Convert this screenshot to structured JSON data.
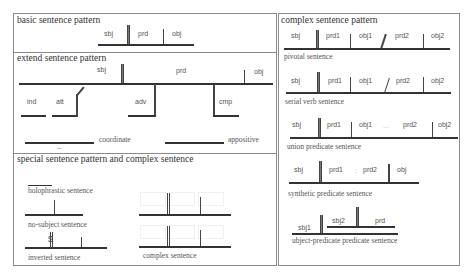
{
  "left_panel": {
    "basic": {
      "title": "basic sentence pattern",
      "labels": [
        "sbj",
        "prd",
        "obj"
      ]
    },
    "extend": {
      "title": "extend sentence pattern",
      "labels": {
        "sbj": "sbj",
        "prd": "prd",
        "obj": "obj",
        "ind": "ind",
        "att": "att",
        "adv": "adv",
        "cmp": "cmp"
      },
      "coordinate": "coordinate",
      "coordinate_dots": "...",
      "appositive": "appositive"
    },
    "special": {
      "title": "special sentence pattern  and complex sentence",
      "holophrastic": "holophrastic sentence",
      "no_subject": "no-subject sentence",
      "inverted": "inverted sentence",
      "inverted_symbol": "$",
      "complex": "complex sentence"
    }
  },
  "right_panel": {
    "title": "complex sentence pattern",
    "pivotal": {
      "caption": "pivotal sentence",
      "labels": [
        "sbj",
        "prd1",
        "obj1",
        "prd2",
        "obj2"
      ]
    },
    "serial": {
      "caption": "serial verb sentence",
      "labels": [
        "sbj",
        "prd1",
        "obj1",
        "prd2",
        "obj2"
      ]
    },
    "union": {
      "caption": "union predicate sentence",
      "labels": [
        "sbj",
        "prd1",
        "obj1",
        "...",
        "prd2",
        "obj2"
      ]
    },
    "synthetic": {
      "caption": "synthetic predicate sentence",
      "labels": [
        "sbj",
        "prd1",
        ":",
        "prd2",
        "obj"
      ]
    },
    "subject_predicate": {
      "caption": "ubject-predicate predicate sentence",
      "labels": [
        "sbj1",
        "sbj2",
        "prd"
      ]
    }
  }
}
